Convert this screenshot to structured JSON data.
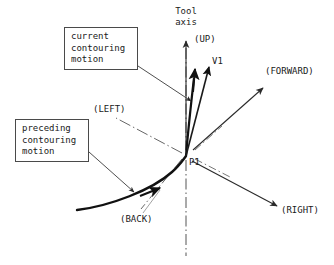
{
  "diagram": {
    "origin_label": "P1",
    "axis_title_line1": "Tool",
    "axis_title_line2": "axis",
    "direction_labels": {
      "up": "(UP)",
      "forward": "(FORWARD)",
      "right": "(RIGHT)",
      "back": "(BACK)",
      "left": "(LEFT)"
    },
    "vectors": {
      "v1": "V1"
    },
    "callouts": [
      {
        "id": "current",
        "lines": [
          "current",
          "contouring",
          "motion"
        ]
      },
      {
        "id": "preceding",
        "lines": [
          "preceding",
          "contouring",
          "motion"
        ]
      }
    ],
    "colors": {
      "stroke": "#1a1a1a",
      "thin_stroke": "#4a4a4a",
      "background": "#ffffff"
    }
  }
}
